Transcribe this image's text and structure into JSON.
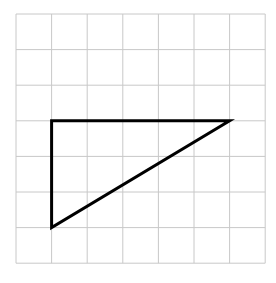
{
  "diagram": {
    "type": "grid-with-triangle",
    "grid": {
      "columns": 7,
      "rows": 7,
      "origin_x": 16,
      "origin_y": 14,
      "cell_size": 35.6,
      "line_color": "#c8c8c8"
    },
    "triangle": {
      "stroke_color": "#000000",
      "stroke_width": 3,
      "vertices_grid": [
        [
          1,
          3
        ],
        [
          6,
          3
        ],
        [
          1,
          6
        ]
      ]
    }
  }
}
